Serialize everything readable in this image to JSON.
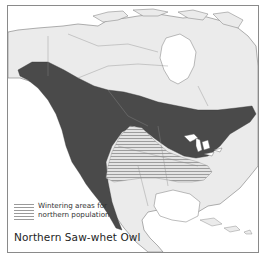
{
  "map": {
    "title": "Northern Saw-whet Owl",
    "region": "North America",
    "legend": {
      "items": [
        {
          "pattern": "horizontal-hatch",
          "label_line1": "Wintering areas for",
          "label_line2": "northern population"
        }
      ]
    },
    "layers": {
      "breeding_range_color": "#4a4a4a",
      "land_color": "#ebebeb",
      "water_color": "#ffffff",
      "border_color": "#8a8a8a",
      "hatch_color": "#9a9a9a"
    }
  }
}
